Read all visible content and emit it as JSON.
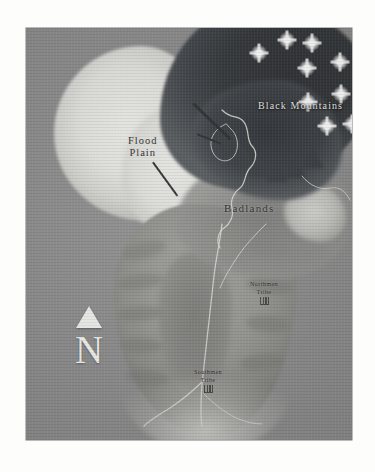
{
  "page": {
    "background_color": "#fdfdfc"
  },
  "map": {
    "plate_background_color": "#8c8c8c",
    "style": "grayscale relief map",
    "regions": [
      {
        "id": "black-mountains",
        "label": "Black Mountains",
        "label_color": "#ececea",
        "terrain": "dark mountain range",
        "position": "northeast"
      },
      {
        "id": "flood-plain",
        "label": "Flood\nPlain",
        "label_color": "#2b2b2b",
        "terrain": "bright lowland basin",
        "position": "northwest"
      },
      {
        "id": "badlands",
        "label": "Badlands",
        "label_color": "#2b2b2b",
        "terrain": "eroded mottled upland",
        "position": "center-north"
      }
    ],
    "settlements": [
      {
        "id": "northmen-tribe",
        "label": "Northmen\nTribe",
        "icon": "settlement-icon",
        "position": "center-east"
      },
      {
        "id": "southmen-tribe",
        "label": "Southmen\nTribe",
        "icon": "settlement-icon",
        "position": "south-center"
      }
    ],
    "compass": {
      "icon": "north-arrow-icon",
      "letter": "N",
      "color": "#f2f2ef"
    },
    "peaks": [
      {
        "x": 259,
        "y": 53
      },
      {
        "x": 287,
        "y": 40
      },
      {
        "x": 312,
        "y": 43
      },
      {
        "x": 307,
        "y": 68
      },
      {
        "x": 340,
        "y": 62
      },
      {
        "x": 308,
        "y": 102
      },
      {
        "x": 341,
        "y": 94
      },
      {
        "x": 327,
        "y": 126
      },
      {
        "x": 352,
        "y": 124
      }
    ]
  }
}
